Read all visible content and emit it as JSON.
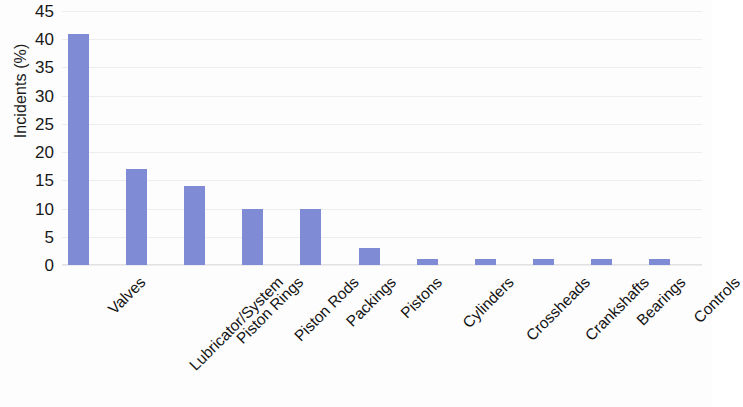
{
  "chart_data": {
    "type": "bar",
    "title": "",
    "xlabel": "",
    "ylabel": "Incidents (%)",
    "ylim": [
      0,
      45
    ],
    "yticks": [
      0,
      5,
      10,
      15,
      20,
      25,
      30,
      35,
      40,
      45
    ],
    "grid": true,
    "legend": null,
    "bar_color": "#7f8bd4",
    "categories": [
      "Valves",
      "Lubricator/System",
      "Piston Rings",
      "Piston Rods",
      "Packings",
      "Pistons",
      "Cylinders",
      "Crossheads",
      "Crankshafts",
      "Bearings",
      "Controls"
    ],
    "values": [
      41,
      17,
      14,
      10,
      10,
      3,
      1,
      1,
      1,
      1,
      1
    ]
  }
}
